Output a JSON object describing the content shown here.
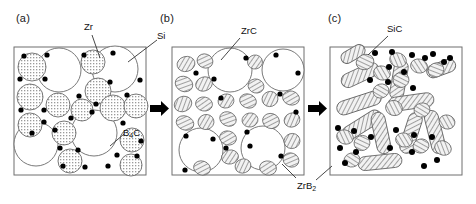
{
  "figure": {
    "type": "microstructure-evolution-diagram",
    "background_color": "#ffffff",
    "line_color": "#333333",
    "fill_white": "#ffffff",
    "fill_hatch": "#e8e8e8",
    "dot_color": "#000000",
    "panels": [
      {
        "id": "a",
        "caption": "(a)",
        "caption_pos": {
          "x": 16,
          "y": 14
        },
        "frame": {
          "x": 14,
          "y": 47,
          "w": 132,
          "h": 128
        },
        "description": "starting powder mixture"
      },
      {
        "id": "b",
        "caption": "(b)",
        "caption_pos": {
          "x": 160,
          "y": 14
        },
        "frame": {
          "x": 172,
          "y": 47,
          "w": 132,
          "h": 128
        },
        "description": "intermediate reaction stage"
      },
      {
        "id": "c",
        "caption": "(c)",
        "caption_pos": {
          "x": 328,
          "y": 14
        },
        "frame": {
          "x": 330,
          "y": 47,
          "w": 132,
          "h": 128
        },
        "description": "final sintered microstructure"
      }
    ],
    "labels": [
      {
        "name": "zr-label",
        "text": "Zr",
        "subscript": "",
        "x": 84,
        "y": 26,
        "leader": [
          [
            94,
            38
          ],
          [
            100,
            58
          ]
        ]
      },
      {
        "name": "si-label",
        "text": "Si",
        "subscript": "",
        "x": 158,
        "y": 30,
        "leader": [
          [
            158,
            40
          ],
          [
            130,
            62
          ]
        ]
      },
      {
        "name": "b4c-label",
        "text": "B",
        "subscript": "4",
        "text_after": "C",
        "x": 124,
        "y": 130,
        "leader": [
          [
            124,
            136
          ],
          [
            108,
            148
          ]
        ]
      },
      {
        "name": "zrc-label",
        "text": "ZrC",
        "subscript": "",
        "x": 242,
        "y": 30,
        "leader": [
          [
            248,
            40
          ],
          [
            222,
            62
          ]
        ]
      },
      {
        "name": "sic-label",
        "text": "SiC",
        "subscript": "",
        "x": 388,
        "y": 26,
        "leader": [
          [
            388,
            36
          ],
          [
            366,
            56
          ]
        ]
      },
      {
        "name": "zrb2-label",
        "text": "ZrB",
        "subscript": "2",
        "x": 298,
        "y": 184,
        "leader_1": [
          [
            314,
            182
          ],
          [
            330,
            168
          ]
        ],
        "leader_2": [
          [
            296,
            180
          ],
          [
            282,
            166
          ]
        ]
      }
    ],
    "arrows": [
      {
        "name": "arrow-a-to-b",
        "x": 150,
        "y": 105,
        "w": 18,
        "h": 9
      },
      {
        "name": "arrow-b-to-c",
        "x": 308,
        "y": 105,
        "w": 18,
        "h": 9
      }
    ],
    "legend_semantics": {
      "white_circle": "Si particle",
      "stippled_circle": "Zr particle",
      "black_dot": "B4C particle",
      "hatched_ellipse_b": "ZrC particle",
      "hatched_ellipse_c": "SiC particle",
      "hatched_rod": "ZrB2 elongated grain"
    }
  }
}
